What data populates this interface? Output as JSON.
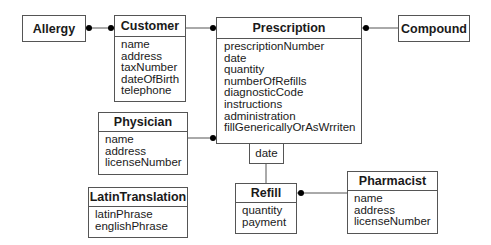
{
  "classes": {
    "allergy": {
      "name": "Allergy",
      "attributes": []
    },
    "customer": {
      "name": "Customer",
      "attributes": [
        "name",
        "address",
        "taxNumber",
        "dateOfBirth",
        "telephone"
      ]
    },
    "prescription": {
      "name": "Prescription",
      "attributes": [
        "prescriptionNumber",
        "date",
        "quantity",
        "numberOfRefills",
        "diagnosticCode",
        "instructions",
        "administration",
        "fillGenericallyOrAsWrriten"
      ]
    },
    "compound": {
      "name": "Compound",
      "attributes": []
    },
    "physician": {
      "name": "Physician",
      "attributes": [
        "name",
        "address",
        "licenseNumber"
      ]
    },
    "latin_translation": {
      "name": "LatinTranslation",
      "attributes": [
        "latinPhrase",
        "englishPhrase"
      ]
    },
    "refill": {
      "name": "Refill",
      "attributes": [
        "quantity",
        "payment"
      ]
    },
    "pharmacist": {
      "name": "Pharmacist",
      "attributes": [
        "name",
        "address",
        "licenseNumber"
      ]
    }
  },
  "qualifiers": {
    "prescription_refill": "date"
  },
  "associations": [
    {
      "from": "Allergy",
      "to": "Customer",
      "from_end": "many",
      "to_end": "many"
    },
    {
      "from": "Customer",
      "to": "Prescription",
      "from_end": "one",
      "to_end": "many"
    },
    {
      "from": "Prescription",
      "to": "Compound",
      "from_end": "many",
      "to_end": "one"
    },
    {
      "from": "Physician",
      "to": "Prescription",
      "from_end": "one",
      "to_end": "many"
    },
    {
      "from": "Prescription",
      "to": "Refill",
      "from_end": "qualified-date",
      "to_end": "one"
    },
    {
      "from": "Refill",
      "to": "Pharmacist",
      "from_end": "many",
      "to_end": "one"
    }
  ]
}
